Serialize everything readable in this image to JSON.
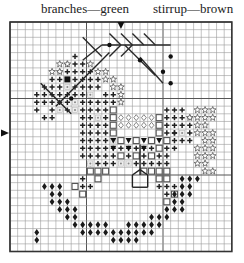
{
  "labels": {
    "left": "branches—green",
    "right": "stirrup—brown"
  },
  "grid": {
    "cols": 29,
    "rows": 30,
    "origin_x": 10,
    "origin_y": 22,
    "cell": 7.65,
    "line_color": "#9a9a9a",
    "border_color": "#333333",
    "center_col_marker": 14,
    "center_row_marker": 14.5
  },
  "colors": {
    "branches": "#2a2a2a",
    "symbol": "#222222",
    "square_fill": "#ffffff",
    "square_stroke": "#555555",
    "star": "#555555"
  },
  "symbols": {
    "plus": [
      [
        8,
        4
      ],
      [
        7,
        5
      ],
      [
        8,
        5
      ],
      [
        9,
        5
      ],
      [
        6,
        6
      ],
      [
        7,
        6
      ],
      [
        8,
        6
      ],
      [
        9,
        6
      ],
      [
        10,
        6
      ],
      [
        5,
        7
      ],
      [
        6,
        7
      ],
      [
        8,
        7
      ],
      [
        9,
        7
      ],
      [
        10,
        7
      ],
      [
        11,
        7
      ],
      [
        4,
        8
      ],
      [
        5,
        8
      ],
      [
        6,
        8
      ],
      [
        8,
        8
      ],
      [
        9,
        8
      ],
      [
        10,
        8
      ],
      [
        11,
        8
      ],
      [
        3,
        9
      ],
      [
        4,
        9
      ],
      [
        5,
        9
      ],
      [
        6,
        9
      ],
      [
        7,
        9
      ],
      [
        8,
        9
      ],
      [
        9,
        9
      ],
      [
        10,
        9
      ],
      [
        12,
        9
      ],
      [
        13,
        9
      ],
      [
        3,
        10
      ],
      [
        4,
        10
      ],
      [
        5,
        10
      ],
      [
        6,
        10
      ],
      [
        7,
        10
      ],
      [
        9,
        10
      ],
      [
        10,
        10
      ],
      [
        11,
        10
      ],
      [
        12,
        10
      ],
      [
        13,
        10
      ],
      [
        3,
        11
      ],
      [
        5,
        11
      ],
      [
        7,
        11
      ],
      [
        9,
        11
      ],
      [
        10,
        11
      ],
      [
        11,
        11
      ],
      [
        12,
        11
      ],
      [
        13,
        11
      ],
      [
        4,
        12
      ],
      [
        5,
        12
      ],
      [
        9,
        12
      ],
      [
        10,
        12
      ],
      [
        11,
        12
      ],
      [
        12,
        12
      ],
      [
        13,
        12
      ],
      [
        9,
        13
      ],
      [
        10,
        13
      ],
      [
        11,
        13
      ],
      [
        12,
        13
      ],
      [
        13,
        13
      ],
      [
        9,
        14
      ],
      [
        10,
        14
      ],
      [
        11,
        14
      ],
      [
        12,
        14
      ],
      [
        13,
        14
      ],
      [
        9,
        15
      ],
      [
        10,
        15
      ],
      [
        11,
        15
      ],
      [
        12,
        15
      ],
      [
        9,
        16
      ],
      [
        10,
        16
      ],
      [
        11,
        16
      ],
      [
        12,
        16
      ],
      [
        13,
        16
      ],
      [
        14,
        16
      ],
      [
        15,
        16
      ],
      [
        16,
        16
      ],
      [
        17,
        16
      ],
      [
        18,
        16
      ],
      [
        19,
        16
      ],
      [
        20,
        16
      ],
      [
        21,
        16
      ],
      [
        9,
        17
      ],
      [
        10,
        17
      ],
      [
        11,
        17
      ],
      [
        12,
        17
      ],
      [
        13,
        17
      ],
      [
        14,
        17
      ],
      [
        15,
        17
      ],
      [
        16,
        17
      ],
      [
        17,
        17
      ],
      [
        18,
        17
      ],
      [
        19,
        17
      ],
      [
        20,
        17
      ],
      [
        10,
        18
      ],
      [
        11,
        18
      ],
      [
        12,
        18
      ],
      [
        13,
        18
      ],
      [
        16,
        18
      ],
      [
        17,
        18
      ],
      [
        18,
        18
      ],
      [
        19,
        18
      ],
      [
        20,
        18
      ],
      [
        20,
        11
      ],
      [
        21,
        11
      ],
      [
        22,
        11
      ],
      [
        20,
        12
      ],
      [
        21,
        12
      ],
      [
        22,
        12
      ],
      [
        23,
        12
      ],
      [
        20,
        13
      ],
      [
        21,
        13
      ],
      [
        22,
        13
      ],
      [
        23,
        13
      ],
      [
        20,
        14
      ],
      [
        21,
        14
      ],
      [
        23,
        14
      ],
      [
        20,
        15
      ],
      [
        21,
        15
      ],
      [
        22,
        15
      ],
      [
        23,
        15
      ],
      [
        21,
        14
      ],
      [
        9,
        20
      ],
      [
        9,
        21
      ],
      [
        8,
        21
      ],
      [
        10,
        21
      ],
      [
        9,
        22
      ],
      [
        20,
        20
      ],
      [
        19,
        21
      ],
      [
        20,
        21
      ],
      [
        21,
        21
      ],
      [
        20,
        22
      ]
    ],
    "dot_square": [
      [
        7,
        8
      ],
      [
        10,
        9
      ],
      [
        8,
        10
      ],
      [
        8,
        11
      ],
      [
        11,
        12
      ],
      [
        6,
        11
      ],
      [
        22,
        14
      ],
      [
        10,
        18
      ],
      [
        14,
        18
      ],
      [
        15,
        18
      ],
      [
        13,
        15
      ]
    ],
    "filled_square": [
      [
        7,
        7
      ]
    ],
    "star": [
      [
        6,
        5
      ],
      [
        7,
        5
      ],
      [
        10,
        5
      ],
      [
        5,
        6
      ],
      [
        6,
        6
      ],
      [
        11,
        6
      ],
      [
        12,
        6
      ],
      [
        12,
        7
      ],
      [
        13,
        7
      ],
      [
        13,
        8
      ],
      [
        14,
        8
      ],
      [
        14,
        9
      ],
      [
        14,
        10
      ],
      [
        24,
        11
      ],
      [
        25,
        11
      ],
      [
        26,
        11
      ],
      [
        23,
        12
      ],
      [
        24,
        12
      ],
      [
        25,
        12
      ],
      [
        26,
        12
      ],
      [
        24,
        13
      ],
      [
        25,
        13
      ],
      [
        24,
        14
      ],
      [
        25,
        14
      ],
      [
        26,
        14
      ],
      [
        25,
        15
      ],
      [
        26,
        15
      ],
      [
        24,
        16
      ],
      [
        25,
        16
      ],
      [
        26,
        16
      ],
      [
        24,
        17
      ],
      [
        25,
        17
      ],
      [
        26,
        17
      ],
      [
        24,
        18
      ],
      [
        25,
        18
      ],
      [
        25,
        19
      ],
      [
        26,
        19
      ]
    ],
    "open_square": [
      [
        13,
        11
      ],
      [
        13,
        12
      ],
      [
        13,
        13
      ],
      [
        13,
        14
      ],
      [
        19,
        12
      ],
      [
        19,
        13
      ],
      [
        19,
        14
      ],
      [
        19,
        16
      ],
      [
        14,
        15
      ],
      [
        16,
        15
      ],
      [
        18,
        15
      ],
      [
        20,
        15
      ],
      [
        14,
        17
      ],
      [
        16,
        17
      ],
      [
        18,
        17
      ],
      [
        10,
        19
      ],
      [
        11,
        19
      ],
      [
        12,
        19
      ],
      [
        11,
        20
      ],
      [
        17,
        19
      ],
      [
        18,
        19
      ],
      [
        19,
        19
      ],
      [
        20,
        19
      ],
      [
        19,
        20
      ],
      [
        20,
        20
      ],
      [
        8,
        21
      ],
      [
        9,
        22
      ],
      [
        21,
        22
      ],
      [
        20,
        23
      ]
    ],
    "diamond_link": [
      [
        14,
        12
      ],
      [
        15,
        12
      ],
      [
        16,
        12
      ],
      [
        17,
        12
      ],
      [
        18,
        12
      ],
      [
        14,
        13
      ],
      [
        15,
        13
      ],
      [
        16,
        13
      ],
      [
        17,
        13
      ],
      [
        18,
        13
      ]
    ],
    "triangle_down": [
      [
        13,
        15
      ],
      [
        15,
        15
      ],
      [
        17,
        15
      ],
      [
        19,
        15
      ],
      [
        13,
        16
      ],
      [
        15,
        16
      ],
      [
        17,
        16
      ]
    ],
    "diamond": [
      [
        4,
        21
      ],
      [
        5,
        21
      ],
      [
        6,
        21
      ],
      [
        5,
        22
      ],
      [
        6,
        22
      ],
      [
        5,
        23
      ],
      [
        6,
        23
      ],
      [
        7,
        23
      ],
      [
        6,
        24
      ],
      [
        7,
        24
      ],
      [
        8,
        24
      ],
      [
        7,
        25
      ],
      [
        8,
        25
      ],
      [
        8,
        26
      ],
      [
        9,
        26
      ],
      [
        10,
        26
      ],
      [
        11,
        26
      ],
      [
        12,
        26
      ],
      [
        9,
        27
      ],
      [
        10,
        27
      ],
      [
        11,
        27
      ],
      [
        12,
        27
      ],
      [
        13,
        27
      ],
      [
        14,
        27
      ],
      [
        15,
        27
      ],
      [
        16,
        27
      ],
      [
        17,
        27
      ],
      [
        18,
        27
      ],
      [
        13,
        28
      ],
      [
        14,
        28
      ],
      [
        15,
        28
      ],
      [
        16,
        28
      ],
      [
        15,
        26
      ],
      [
        16,
        26
      ],
      [
        17,
        26
      ],
      [
        18,
        26
      ],
      [
        19,
        26
      ],
      [
        18,
        25
      ],
      [
        19,
        25
      ],
      [
        20,
        25
      ],
      [
        20,
        24
      ],
      [
        21,
        24
      ],
      [
        22,
        24
      ],
      [
        21,
        23
      ],
      [
        22,
        23
      ],
      [
        21,
        22
      ],
      [
        22,
        22
      ],
      [
        23,
        22
      ],
      [
        22,
        21
      ],
      [
        23,
        21
      ],
      [
        22,
        20
      ],
      [
        23,
        20
      ],
      [
        24,
        20
      ],
      [
        3,
        27
      ],
      [
        3,
        28
      ]
    ]
  },
  "lines": {
    "branches": [
      [
        [
          12,
          3
        ],
        [
          21,
          3
        ]
      ],
      [
        [
          15,
          3
        ],
        [
          19,
          7
        ]
      ],
      [
        [
          17,
          4.6
        ],
        [
          20,
          8
        ]
      ],
      [
        [
          13,
          1.5
        ],
        [
          14.5,
          3
        ]
      ],
      [
        [
          13,
          4.5
        ],
        [
          14.5,
          3
        ]
      ],
      [
        [
          14.5,
          1.5
        ],
        [
          16,
          3
        ]
      ],
      [
        [
          14.5,
          4.5
        ],
        [
          16,
          3
        ]
      ],
      [
        [
          16,
          1.5
        ],
        [
          17.5,
          3
        ]
      ],
      [
        [
          17.5,
          1.5
        ],
        [
          19,
          3
        ]
      ],
      [
        [
          9.5,
          2
        ],
        [
          12,
          4.5
        ]
      ],
      [
        [
          9.5,
          5
        ],
        [
          12,
          3
        ]
      ]
    ],
    "stirrup": [
      [
        [
          4,
          8
        ],
        [
          8,
          12
        ]
      ],
      [
        [
          6,
          11
        ],
        [
          13,
          4
        ]
      ],
      [
        [
          17,
          16
        ],
        [
          17,
          20
        ]
      ],
      [
        [
          16,
          20
        ],
        [
          17,
          19.3
        ]
      ],
      [
        [
          18,
          20
        ],
        [
          17,
          19.3
        ]
      ],
      [
        [
          16,
          20
        ],
        [
          16,
          21.6
        ]
      ],
      [
        [
          18,
          20
        ],
        [
          18,
          21.6
        ]
      ],
      [
        [
          16,
          21.6
        ],
        [
          18,
          21.6
        ]
      ]
    ],
    "dots": [
      [
        13,
        3
      ],
      [
        17,
        5
      ],
      [
        21,
        4.5
      ],
      [
        20,
        6.5
      ],
      [
        21,
        8
      ],
      [
        8,
        10
      ]
    ]
  }
}
